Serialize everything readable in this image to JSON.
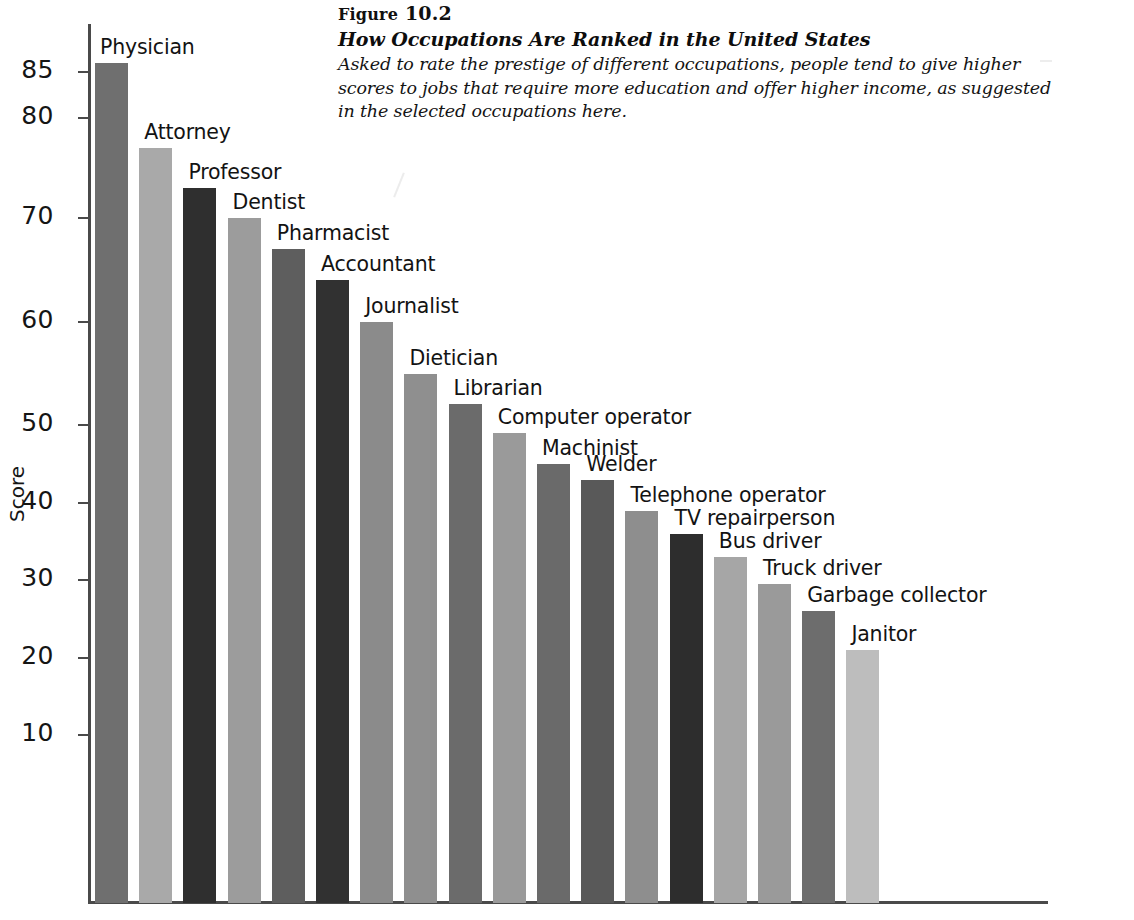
{
  "figure": {
    "number_prefix": "Figure",
    "number": "10.2",
    "title": "How Occupations Are Ranked in the United States",
    "description": "Asked to rate the prestige of different occupations, people tend to give higher scores to jobs that require more education and offer higher income, as suggested in the selected occupations here."
  },
  "chart_data": {
    "type": "bar",
    "title": "How Occupations Are Ranked in the United States",
    "xlabel": "",
    "ylabel": "Score",
    "ylim": [
      0,
      90
    ],
    "grid": false,
    "legend": "none",
    "tick_labels": [
      "85",
      "80",
      "70",
      "60",
      "50",
      "40",
      "30",
      "20",
      "10"
    ],
    "tick_values": [
      85,
      80,
      70,
      60,
      50,
      40,
      30,
      20,
      10
    ],
    "categories": [
      "Physician",
      "Attorney",
      "Professor",
      "Dentist",
      "Pharmacist",
      "Accountant",
      "Journalist",
      "Dietician",
      "Librarian",
      "Computer operator",
      "Machinist",
      "Welder",
      "Telephone operator",
      "TV repairperson",
      "Bus driver",
      "Truck driver",
      "Garbage collector",
      "Janitor"
    ],
    "values": [
      86,
      77,
      73,
      70,
      67,
      64,
      60,
      55,
      52,
      49,
      45,
      43,
      39,
      36,
      33,
      29.5,
      26,
      21
    ],
    "bar_colors": [
      "#6f6f6f",
      "#a9a9a9",
      "#2f2f2f",
      "#9c9c9c",
      "#5e5e5e",
      "#313131",
      "#8b8b8b",
      "#8f8f8f",
      "#6b6b6b",
      "#9a9a9a",
      "#6a6a6a",
      "#595959",
      "#8e8e8e",
      "#2d2d2d",
      "#a6a6a6",
      "#9a9a9a",
      "#6d6d6d",
      "#bdbdbd"
    ]
  }
}
